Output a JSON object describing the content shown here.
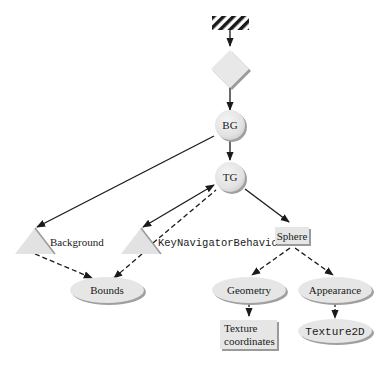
{
  "diagram": {
    "type": "scene-graph",
    "nodes": {
      "locale": {
        "shape": "hatched-rectangle",
        "label": ""
      },
      "view_platform": {
        "shape": "diamond",
        "label": ""
      },
      "bg": {
        "shape": "circle",
        "label": "BG"
      },
      "tg": {
        "shape": "circle",
        "label": "TG"
      },
      "background": {
        "shape": "triangle",
        "label": "Background"
      },
      "key_navigator": {
        "shape": "triangle",
        "label": "KeyNavigatorBehavior"
      },
      "sphere": {
        "shape": "rectangle",
        "label": "Sphere"
      },
      "bounds": {
        "shape": "ellipse",
        "label": "Bounds"
      },
      "geometry": {
        "shape": "ellipse",
        "label": "Geometry"
      },
      "appearance": {
        "shape": "ellipse",
        "label": "Appearance"
      },
      "texture_coords": {
        "shape": "rectangle",
        "label_line1": "Texture",
        "label_line2": "coordinates"
      },
      "texture2d": {
        "shape": "ellipse",
        "label": "Texture2D"
      }
    },
    "edges": [
      {
        "from": "locale",
        "to": "view_platform",
        "style": "solid"
      },
      {
        "from": "view_platform",
        "to": "bg",
        "style": "solid"
      },
      {
        "from": "bg",
        "to": "tg",
        "style": "solid"
      },
      {
        "from": "bg",
        "to": "background",
        "style": "solid"
      },
      {
        "from": "tg",
        "to": "key_navigator",
        "style": "solid-bidirectional"
      },
      {
        "from": "key_navigator",
        "to": "tg",
        "style": "dashed"
      },
      {
        "from": "tg",
        "to": "sphere",
        "style": "solid"
      },
      {
        "from": "background",
        "to": "bounds",
        "style": "dashed"
      },
      {
        "from": "key_navigator",
        "to": "bounds",
        "style": "dashed"
      },
      {
        "from": "sphere",
        "to": "geometry",
        "style": "dashed"
      },
      {
        "from": "sphere",
        "to": "appearance",
        "style": "dashed"
      },
      {
        "from": "geometry",
        "to": "texture_coords",
        "style": "dashed"
      },
      {
        "from": "appearance",
        "to": "texture2d",
        "style": "dashed"
      }
    ],
    "colors": {
      "node_fill": "#e6e6e6",
      "node_shadow": "#9a9a9a",
      "line": "#1a1a1a",
      "hatch": "#1a1a1a"
    }
  }
}
